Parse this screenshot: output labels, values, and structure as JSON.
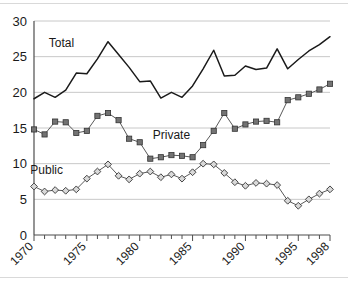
{
  "chart_data": {
    "type": "line",
    "title": "",
    "subtitle": "",
    "xlabel": "",
    "ylabel": "",
    "xlim": [
      1970,
      1998
    ],
    "ylim": [
      0,
      30
    ],
    "yticks": [
      0,
      5,
      10,
      15,
      20,
      25,
      30
    ],
    "ytick_labels": [
      "0",
      "5",
      "10",
      "15",
      "20",
      "25",
      "30"
    ],
    "x": [
      1970,
      1971,
      1972,
      1973,
      1974,
      1975,
      1976,
      1977,
      1978,
      1979,
      1980,
      1981,
      1982,
      1983,
      1984,
      1985,
      1986,
      1987,
      1988,
      1989,
      1990,
      1991,
      1992,
      1993,
      1994,
      1995,
      1996,
      1997,
      1998
    ],
    "xtick_labels": [
      "1970",
      "1975",
      "1980",
      "1985",
      "1990",
      "1995",
      "1998"
    ],
    "xticks_major": [
      1970,
      1975,
      1980,
      1985,
      1990,
      1995,
      1998
    ],
    "grid": "horizontal",
    "legend_position": "inline-annotations",
    "series": [
      {
        "name": "Total",
        "label": "Total",
        "marker": "none",
        "color": "#1a1a1a",
        "values": [
          19.1,
          20.0,
          19.3,
          20.3,
          22.7,
          22.6,
          24.7,
          27.1,
          25.3,
          23.5,
          21.5,
          21.6,
          19.2,
          20.0,
          19.3,
          20.9,
          23.3,
          25.9,
          22.3,
          22.4,
          23.7,
          23.2,
          23.4,
          26.1,
          23.3,
          24.6,
          25.8,
          26.7,
          27.8
        ]
      },
      {
        "name": "Private",
        "label": "Private",
        "marker": "square",
        "color": "#595959",
        "values": [
          14.8,
          14.1,
          15.9,
          15.8,
          14.3,
          14.6,
          16.7,
          17.1,
          16.1,
          13.5,
          13.0,
          10.7,
          10.9,
          11.2,
          11.1,
          10.9,
          12.6,
          14.6,
          17.1,
          14.9,
          15.5,
          15.9,
          16.0,
          15.8,
          18.9,
          19.3,
          19.8,
          20.4,
          21.2
        ]
      },
      {
        "name": "Public",
        "label": "Public",
        "marker": "diamond",
        "color": "#595959",
        "values": [
          6.8,
          6.1,
          6.3,
          6.2,
          6.4,
          7.9,
          8.9,
          9.9,
          8.3,
          7.8,
          8.6,
          8.9,
          8.1,
          8.5,
          7.9,
          8.8,
          10.0,
          9.9,
          8.7,
          7.4,
          6.9,
          7.3,
          7.2,
          7.0,
          4.8,
          4.1,
          5.0,
          5.8,
          6.4
        ]
      }
    ],
    "annotations": [
      {
        "text": "Total",
        "x": 1972.6,
        "y": 26.4
      },
      {
        "text": "Private",
        "x": 1983.0,
        "y": 13.5
      },
      {
        "text": "Public",
        "x": 1971.2,
        "y": 8.5
      }
    ]
  }
}
